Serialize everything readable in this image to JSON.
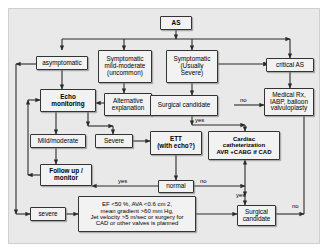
{
  "diagram": {
    "background_color": "#e9e9e9",
    "node_fill_color": "#f2f2f2",
    "node_border_color": "#333333",
    "edge_color": "#2b2b2b"
  },
  "nodes": [
    {
      "id": "as",
      "label": "AS"
    },
    {
      "id": "asymptomatic",
      "label": "asymptomatic"
    },
    {
      "id": "sympmild",
      "label": "Symptomatic\nmild-moderate\n(uncommon)"
    },
    {
      "id": "sympsevere",
      "label": "Symptomatic\n(Usually\nSevere)"
    },
    {
      "id": "criticalas",
      "label": "critical AS"
    },
    {
      "id": "echo",
      "label": "Echo\nmonitoring"
    },
    {
      "id": "altexp",
      "label": "Alternative\nexplanation"
    },
    {
      "id": "surgcand1",
      "label": "Surgical candidate"
    },
    {
      "id": "medrx",
      "label": "Medical Rx,\nIABP, balloon\nvalvuloplasty"
    },
    {
      "id": "mildmod",
      "label": "Mild/moderate"
    },
    {
      "id": "severe1",
      "label": "Severe"
    },
    {
      "id": "ett",
      "label": "ETT\n(with echo?)"
    },
    {
      "id": "cathlab",
      "label": "Cardiac\ncatheterization\nAVR +CABG if CAD"
    },
    {
      "id": "followup",
      "label": "Follow up /\nmonitor"
    },
    {
      "id": "normal",
      "label": "normal"
    },
    {
      "id": "severe2",
      "label": "severe"
    },
    {
      "id": "criteria",
      "label": "EF <50 %, AVA <0.6 cm 2,\nmean gradient >60 mm Hg,\nJet velocity >5 m/sec or surgery for\nCAD or other valves is planned"
    },
    {
      "id": "surgcand2",
      "label": "Surgical\ncandidate"
    }
  ],
  "edge_labels": [
    {
      "id": "no-top",
      "text": "no"
    },
    {
      "id": "yes-surg1",
      "text": "yes"
    },
    {
      "id": "yes-normal",
      "text": "yes"
    },
    {
      "id": "no-normal",
      "text": "no"
    },
    {
      "id": "yes-surg2",
      "text": "yes"
    },
    {
      "id": "no-surg2",
      "text": "no"
    }
  ]
}
